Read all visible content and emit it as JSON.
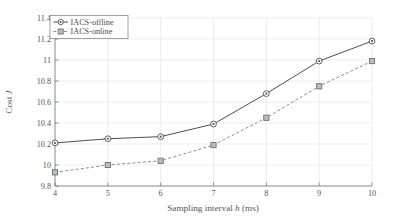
{
  "chart_data": {
    "type": "line",
    "title": "",
    "xlabel": "Sampling interval h (ms)",
    "ylabel": "Cost J",
    "xlabel_parts": {
      "pre": "Sampling interval ",
      "italic": "h",
      "post": " (ms)"
    },
    "ylabel_parts": {
      "pre": "Cost ",
      "italic": "J",
      "post": ""
    },
    "x": [
      4,
      5,
      6,
      7,
      8,
      9,
      10
    ],
    "xlim": [
      4,
      10
    ],
    "ylim": [
      9.8,
      11.4
    ],
    "xticks": [
      "4",
      "5",
      "6",
      "7",
      "8",
      "9",
      "10"
    ],
    "yticks": [
      "9.8",
      "10",
      "10.2",
      "10.4",
      "10.6",
      "10.8",
      "11",
      "11.2",
      "11.4"
    ],
    "ytick_values": [
      9.8,
      10.0,
      10.2,
      10.4,
      10.6,
      10.8,
      11.0,
      11.2,
      11.4
    ],
    "grid": true,
    "legend_position": "top-left",
    "series": [
      {
        "name": "IACS-offline",
        "marker": "circle",
        "linestyle": "solid",
        "color": "#4d4d4d",
        "values": [
          10.21,
          10.25,
          10.27,
          10.39,
          10.68,
          10.99,
          11.18
        ]
      },
      {
        "name": "IACS-online",
        "marker": "square",
        "linestyle": "dashed",
        "color": "#8c8c8c",
        "values": [
          9.93,
          10.0,
          10.04,
          10.19,
          10.45,
          10.75,
          10.99
        ]
      }
    ]
  },
  "legend": {
    "items": [
      {
        "label": "IACS-offline"
      },
      {
        "label": "IACS-online"
      }
    ]
  }
}
